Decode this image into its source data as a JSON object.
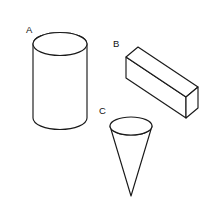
{
  "figure": {
    "background_color": "#ffffff",
    "stroke_color": "#1a1a1a",
    "fill_color": "#ffffff",
    "label_color": "#111111",
    "width": 221,
    "height": 213
  },
  "shapes": [
    {
      "id": "cylinder",
      "label": "A",
      "name": "cylinder",
      "label_x": 26,
      "label_y": 33,
      "geometry": {
        "center_x": 60,
        "top_ellipse_cy": 44,
        "bottom_ellipse_cy": 118,
        "rx": 27,
        "ry": 11.5,
        "left_x": 33,
        "right_x": 87
      }
    },
    {
      "id": "rectangular-prism",
      "label": "B",
      "name": "rectangular prism",
      "label_x": 113,
      "label_y": 47,
      "geometry": {
        "front_top_left_x": 126,
        "front_top_left_y": 57,
        "front_top_right_x": 186,
        "front_top_right_y": 97,
        "front_bottom_left_x": 126,
        "front_bottom_left_y": 78,
        "front_bottom_right_x": 186,
        "front_bottom_right_y": 118,
        "depth_dx": 12,
        "depth_dy": -10
      }
    },
    {
      "id": "cone",
      "label": "C",
      "name": "cone",
      "label_x": 99,
      "label_y": 114,
      "geometry": {
        "center_x": 131,
        "ellipse_cy": 126,
        "rx": 21,
        "ry": 9,
        "apex_x": 131,
        "apex_y": 196
      }
    }
  ]
}
